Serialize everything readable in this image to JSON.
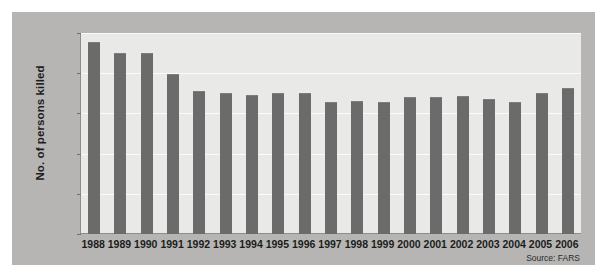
{
  "chart_data": {
    "type": "bar",
    "title": "",
    "subtitle": "",
    "xlabel": "",
    "ylabel": "No. of persons killed",
    "categories": [
      "1988",
      "1989",
      "1990",
      "1991",
      "1992",
      "1993",
      "1994",
      "1995",
      "1996",
      "1997",
      "1998",
      "1999",
      "2000",
      "2001",
      "2002",
      "2003",
      "2004",
      "2005",
      "2006"
    ],
    "values": [
      23900,
      22500,
      22500,
      19900,
      17800,
      17500,
      17300,
      17500,
      17500,
      16400,
      16500,
      16400,
      17000,
      17000,
      17200,
      16800,
      16400,
      17600,
      18100
    ],
    "ylim": [
      0,
      25000
    ],
    "yticks": [
      0,
      5000,
      10000,
      15000,
      20000,
      25000
    ],
    "ytick_labels": [
      "0",
      "5,000",
      "10,000",
      "15,000",
      "20,000",
      "25,000"
    ],
    "grid": true,
    "legend": "none",
    "annotations": [
      "Source: FARS"
    ],
    "bar_color": "#6b6b6b",
    "plot_background": "#e9e9e7",
    "panel_background": "#b6b5b3"
  },
  "source_note": "Source: FARS"
}
